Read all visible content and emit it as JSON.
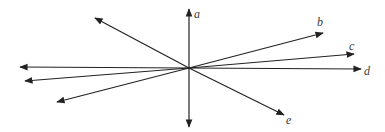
{
  "diagram": {
    "type": "lines-through-point",
    "center": [
      189,
      68
    ],
    "stroke_color": "#222222",
    "label_color": "#3a3a3a",
    "rays": [
      {
        "id": "a",
        "end": [
          189,
          9
        ],
        "label": "a",
        "label_pos": [
          194,
          18
        ]
      },
      {
        "id": "down",
        "end": [
          189,
          127
        ],
        "label": null
      },
      {
        "id": "b",
        "end": [
          323,
          33
        ],
        "label": "b",
        "label_pos": [
          317,
          26
        ]
      },
      {
        "id": "c",
        "end": [
          354,
          54
        ],
        "label": "c",
        "label_pos": [
          349,
          50
        ]
      },
      {
        "id": "d",
        "end": [
          361,
          69
        ],
        "label": "d",
        "label_pos": [
          364,
          75
        ]
      },
      {
        "id": "e",
        "end": [
          284,
          115
        ],
        "label": "e",
        "label_pos": [
          286,
          124
        ]
      },
      {
        "id": "upper-left",
        "end": [
          95,
          18
        ],
        "label": null
      },
      {
        "id": "left",
        "end": [
          20,
          67
        ],
        "label": null
      },
      {
        "id": "left-lower",
        "end": [
          25,
          81
        ],
        "label": null
      },
      {
        "id": "lower-left",
        "end": [
          57,
          102
        ],
        "label": null
      }
    ]
  }
}
